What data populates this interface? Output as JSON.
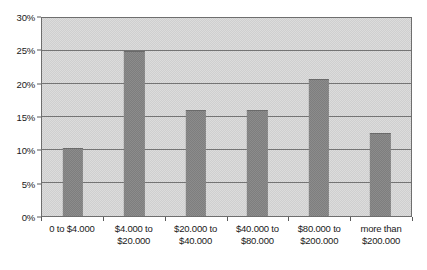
{
  "chart_data": {
    "type": "bar",
    "title": "",
    "xlabel": "",
    "ylabel": "",
    "categories": [
      "0 to $4.000",
      "$4.000 to\n$20.000",
      "$20.000 to\n$40.000",
      "$40.000 to\n$80.000",
      "$80.000 to\n$200.000",
      "more than\n$200.000"
    ],
    "values": [
      10.3,
      25.0,
      16.1,
      16.1,
      20.7,
      12.6
    ],
    "ylim": [
      0,
      30
    ],
    "ytick_labels": [
      "0%",
      "5%",
      "10%",
      "15%",
      "20%",
      "25%",
      "30%"
    ],
    "ytick_values": [
      0,
      5,
      10,
      15,
      20,
      25,
      30
    ],
    "grid": true,
    "legend": null,
    "colors": {
      "bar_fill": "#8f8f8f",
      "plot_background": "#dcdcdc",
      "gridline": "#747474",
      "border": "#6e6e6e",
      "text": "#1a1a1a"
    }
  }
}
